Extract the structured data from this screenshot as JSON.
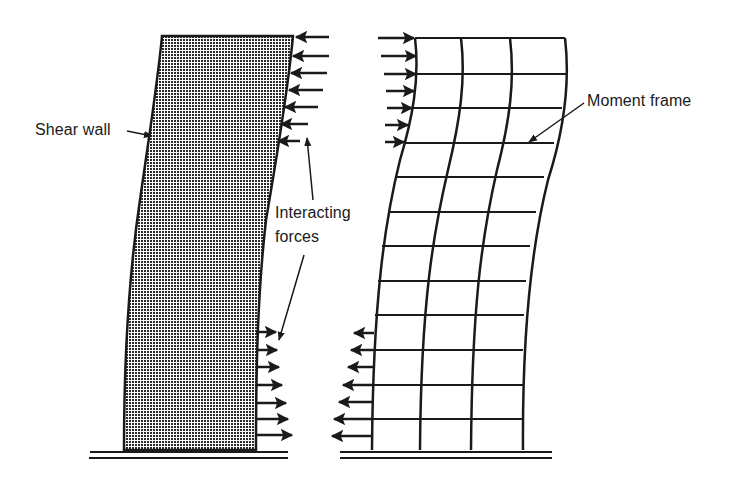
{
  "labels": {
    "shear_wall": "Shear wall",
    "interacting_line1": "Interacting",
    "interacting_line2": "forces",
    "moment_frame": "Moment frame"
  },
  "colors": {
    "ink": "#1a1a1a",
    "background": "#ffffff"
  },
  "shear_wall": {
    "top_arrows_count": 7,
    "bottom_arrows_count": 7,
    "top_arrow_direction": "left",
    "bottom_arrow_direction": "right"
  },
  "moment_frame": {
    "bays": 3,
    "stories": 12,
    "top_arrows_count": 7,
    "bottom_arrows_count": 7,
    "top_arrow_direction": "right",
    "bottom_arrow_direction": "left"
  }
}
